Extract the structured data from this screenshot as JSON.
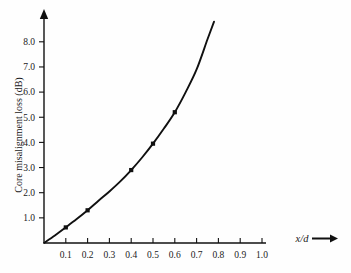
{
  "chart_data": {
    "type": "line",
    "title": "",
    "xlabel": "x/d",
    "ylabel": "Core misalignment loss (dB)",
    "xlim": [
      0,
      1.05
    ],
    "ylim": [
      0,
      8.9
    ],
    "grid": false,
    "legend": null,
    "x_ticks": [
      "0.1",
      "0.2",
      "0.3",
      "0.4",
      "0.5",
      "0.6",
      "0.7",
      "0.8",
      "0.9",
      "1.0"
    ],
    "x_tick_values": [
      0.1,
      0.2,
      0.3,
      0.4,
      0.5,
      0.6,
      0.7,
      0.8,
      0.9,
      1.0
    ],
    "y_ticks": [
      "1.0",
      "2.0",
      "3.0",
      "4.0",
      "5.0",
      "6.0",
      "7.0",
      "8.0"
    ],
    "y_tick_values": [
      1.0,
      2.0,
      3.0,
      4.0,
      5.0,
      6.0,
      7.0,
      8.0
    ],
    "x": [
      0,
      0.05,
      0.1,
      0.15,
      0.2,
      0.25,
      0.3,
      0.35,
      0.4,
      0.45,
      0.5,
      0.55,
      0.6,
      0.65,
      0.7,
      0.75,
      0.78
    ],
    "values": [
      0,
      0.3,
      0.62,
      0.95,
      1.3,
      1.68,
      2.05,
      2.45,
      2.9,
      3.4,
      3.95,
      4.55,
      5.2,
      6.0,
      6.9,
      8.1,
      8.8
    ],
    "markers": [
      {
        "x": 0.1,
        "y": 0.62
      },
      {
        "x": 0.2,
        "y": 1.3
      },
      {
        "x": 0.4,
        "y": 2.9
      },
      {
        "x": 0.5,
        "y": 3.95
      },
      {
        "x": 0.6,
        "y": 5.2
      }
    ],
    "x_axis_arrow": true,
    "y_axis_arrow": true
  }
}
